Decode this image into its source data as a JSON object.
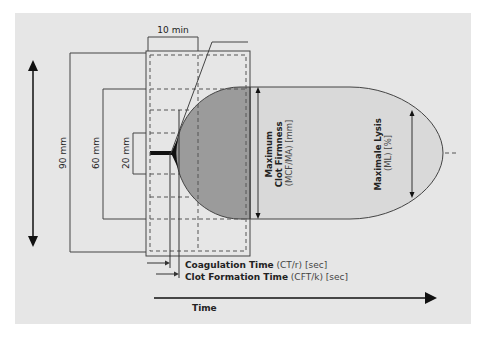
{
  "diagram": {
    "colors": {
      "background": "#ffffff",
      "panel": "#e6e6e6",
      "line": "#333333",
      "clot_dark": "#9b9b9b",
      "clot_light": "#d9d9d9",
      "black": "#111111"
    },
    "labels": {
      "ten_min": "10 min",
      "mm90": "90 mm",
      "mm60": "60 mm",
      "mm20": "20 mm",
      "mcf_line1": "Maximum",
      "mcf_line2": "Clot Firmness",
      "mcf_line3": "(MCF/MA) [mm]",
      "ml_line1": "Maximale Lysis",
      "ml_line2": "(ML) [%]",
      "ct_bold": "Coagulation Time",
      "ct_rest": " (CT/r) [sec]",
      "cft_bold": "Clot Formation Time",
      "cft_rest": " (CFT/k) [sec]",
      "time_axis": "Time"
    }
  }
}
